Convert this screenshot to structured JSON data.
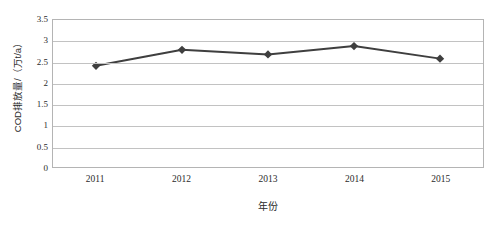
{
  "chart_data": {
    "type": "line",
    "title": "",
    "subtitle": "",
    "xlabel": "年份",
    "ylabel": "COD排放量/（万t/a）",
    "categories": [
      "2011",
      "2012",
      "2013",
      "2014",
      "2015"
    ],
    "values": [
      2.41,
      2.79,
      2.68,
      2.88,
      2.58
    ],
    "series": [
      {
        "name": "COD排放量",
        "values": [
          2.41,
          2.79,
          2.68,
          2.88,
          2.58
        ]
      }
    ],
    "ylim": [
      0,
      3.5
    ],
    "y_tick_step": 0.5,
    "y_ticks": [
      "0",
      "0.5",
      "1",
      "1.5",
      "2",
      "2.5",
      "3",
      "3.5"
    ],
    "x_ticks": [
      "2011",
      "2012",
      "2013",
      "2014",
      "2015"
    ],
    "grid": "horizontal",
    "legend": "none",
    "marker": "diamond",
    "colors": {
      "line": "#3f3f3f",
      "marker": "#3f3f3f",
      "gridline": "#c2c2c2",
      "plot_border": "#b4b4b4",
      "text": "#2b2b2b",
      "background": "#ffffff"
    }
  }
}
